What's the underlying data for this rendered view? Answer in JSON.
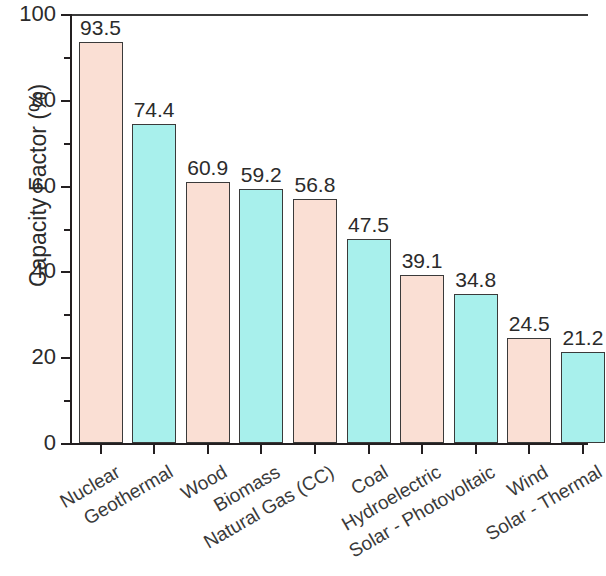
{
  "chart_data": {
    "type": "bar",
    "title": "",
    "xlabel": "",
    "ylabel": "Capacity Factor (%)",
    "ylim": [
      0,
      100
    ],
    "ytick_labels": [
      "0",
      "20",
      "40",
      "60",
      "80",
      "100"
    ],
    "ytick_values": [
      0,
      20,
      40,
      60,
      80,
      100
    ],
    "minor_tick_values": [
      10,
      30,
      50,
      70,
      90
    ],
    "grid": false,
    "legend": "none",
    "bar_label_format": "one-decimal",
    "categories": [
      "Nuclear",
      "Geothermal",
      "Wood",
      "Biomass",
      "Natural Gas (CC)",
      "Coal",
      "Hydroelectric",
      "Solar - Photovoltaic",
      "Wind",
      "Solar - Thermal"
    ],
    "values": [
      93.5,
      74.4,
      60.9,
      59.2,
      56.8,
      47.5,
      39.1,
      34.8,
      24.5,
      21.2
    ],
    "value_labels": [
      "93.5",
      "74.4",
      "60.9",
      "59.2",
      "56.8",
      "47.5",
      "39.1",
      "34.8",
      "24.5",
      "21.2"
    ],
    "bar_colors": [
      "#fadfd4",
      "#a8f0ec",
      "#fadfd4",
      "#a8f0ec",
      "#fadfd4",
      "#a8f0ec",
      "#fadfd4",
      "#a8f0ec",
      "#fadfd4",
      "#a8f0ec"
    ],
    "bar_edge_color": "#3a3a3a",
    "axis_color": "#231f20",
    "text_color": "#2b2b2b",
    "background_color": "#ffffff",
    "xlabel_rotation_degrees": -30
  }
}
